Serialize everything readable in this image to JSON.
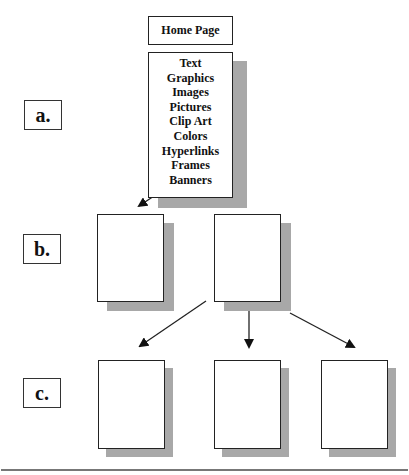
{
  "diagram": {
    "home_page": {
      "label": "Home Page"
    },
    "content_items": [
      "Text",
      "Graphics",
      "Images",
      "Pictures",
      "Clip Art",
      "Colors",
      "Hyperlinks",
      "Frames",
      "Banners"
    ],
    "levels": [
      {
        "label": "a."
      },
      {
        "label": "b."
      },
      {
        "label": "c."
      }
    ],
    "pages": {
      "level_b": 2,
      "level_c": 3
    },
    "colors": {
      "border": "#222222",
      "shadow": "#a8a8a8",
      "rule": "#777777"
    }
  }
}
